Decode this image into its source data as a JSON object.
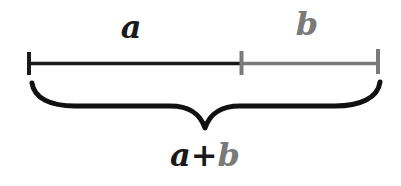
{
  "diagram": {
    "segments": [
      {
        "label": "a",
        "x1": 28,
        "x2": 241,
        "color": "#1a1a1a"
      },
      {
        "label": "b",
        "x1": 241,
        "x2": 378,
        "color": "#7a7a7a"
      }
    ],
    "sum_label": {
      "part1": "a",
      "operator": "+",
      "part2": "b"
    },
    "colors": {
      "a": "#1a1a1a",
      "b": "#7a7a7a",
      "brace": "#111111",
      "background": "#ffffff"
    }
  }
}
